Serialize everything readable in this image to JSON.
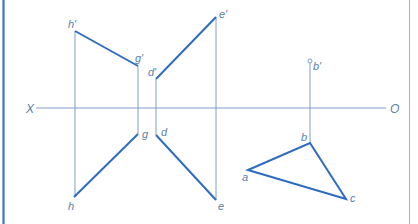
{
  "colors": {
    "frame": "#3f78c2",
    "thin_line": "#7f9fc8",
    "thick_line": "#2f6cc0",
    "label": "#5a7fa8",
    "background": "#ffffff"
  },
  "axis": {
    "left_label": "X",
    "right_label": "O",
    "y": 108,
    "x_start": 35,
    "x_end": 386
  },
  "labels": {
    "h_prime": "h'",
    "g_prime": "g'",
    "d_prime": "d'",
    "e_prime": "e'",
    "b_prime": "b'",
    "g": "g",
    "d": "d",
    "h": "h",
    "e": "e",
    "a": "a",
    "b": "b",
    "c": "c"
  },
  "points": {
    "h_prime": [
      75,
      31
    ],
    "g_prime": [
      138,
      66
    ],
    "d_prime": [
      156,
      79
    ],
    "e_prime": [
      216,
      17
    ],
    "b_prime": [
      310,
      61
    ],
    "g": [
      138,
      134
    ],
    "h": [
      74,
      197
    ],
    "d": [
      156,
      135
    ],
    "e": [
      216,
      200
    ],
    "a": [
      248,
      170
    ],
    "b": [
      310,
      143
    ],
    "c": [
      346,
      199
    ]
  }
}
